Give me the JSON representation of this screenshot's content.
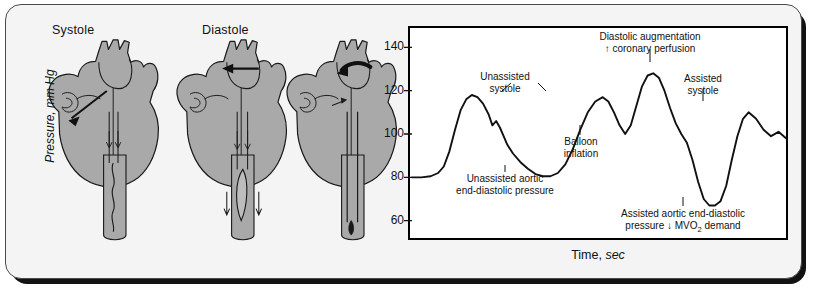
{
  "figure": {
    "anatomy": {
      "labels": [
        {
          "id": "systole",
          "text": "Systole"
        },
        {
          "id": "diastole",
          "text": "Diastole"
        }
      ]
    }
  },
  "chart_data": {
    "type": "line",
    "title": "",
    "xlabel": "Time, sec",
    "ylabel": "Pressure, mm Hg",
    "ylim": [
      52,
      148
    ],
    "yticks": [
      60,
      80,
      100,
      120,
      140
    ],
    "ytick_labels": [
      "60",
      "80",
      "100",
      "120",
      "140"
    ],
    "xlim": [
      0,
      100
    ],
    "xticks": [],
    "grid": false,
    "legend": false,
    "series": [
      {
        "name": "aortic pressure waveform",
        "x": [
          0,
          2.5,
          5,
          7,
          8.5,
          10,
          11.5,
          13,
          14.5,
          16,
          17.5,
          19,
          20.5,
          21.5,
          22.5,
          23.5,
          24.5,
          25.5,
          27,
          29,
          31,
          33,
          35,
          37,
          39,
          41,
          43,
          45,
          47,
          49,
          51,
          52.5,
          54,
          55.5,
          57,
          58.5,
          60,
          61.5,
          63,
          64.5,
          66,
          67.5,
          69,
          70.5,
          72,
          73.5,
          75,
          76.5,
          78,
          79.5,
          81,
          82.5,
          84,
          85.5,
          87,
          88.5,
          90,
          92,
          94,
          96,
          98,
          100
        ],
        "y": [
          80,
          80,
          80.5,
          82,
          85,
          92,
          102,
          111,
          116,
          118,
          117,
          114,
          109,
          104,
          106,
          103,
          99,
          95,
          91,
          87,
          84,
          81.5,
          80.5,
          80.5,
          82,
          86,
          93,
          102,
          110,
          115,
          117,
          115,
          110,
          104,
          100,
          104,
          113,
          122,
          127,
          128,
          126,
          120,
          112,
          105,
          100,
          96,
          88,
          78,
          70,
          67,
          67,
          69,
          76,
          88,
          99,
          107,
          110,
          107,
          102,
          99,
          101,
          98
        ]
      }
    ],
    "annotations": [
      {
        "id": "unassisted-systole",
        "text": "Unassisted\nsystole",
        "line1": "Unassisted",
        "line2": "systole"
      },
      {
        "id": "diastolic-augmentation",
        "text": "Diastolic augmentation\n↑ coronary perfusion",
        "line1": "Diastolic augmentation",
        "line2": "↑ coronary perfusion"
      },
      {
        "id": "balloon-inflation",
        "text": "Balloon\ninflation",
        "line1": "Balloon",
        "line2": "inflation"
      },
      {
        "id": "assisted-systole",
        "text": "Assisted\nsystole",
        "line1": "Assisted",
        "line2": "systole"
      },
      {
        "id": "unassisted-aortic-edp",
        "text": "Unassisted aortic\nend-diastolic pressure",
        "line1": "Unassisted aortic",
        "line2": "end-diastolic pressure"
      },
      {
        "id": "assisted-aortic-edp",
        "text": "Assisted aortic end-diastolic\npressure ↓ MVO2 demand",
        "line1": "Assisted aortic end-diastolic",
        "line2_pre": "pressure ↓ MVO",
        "line2_sub": "2",
        "line2_post": " demand"
      }
    ]
  },
  "colors": {
    "heart_fill": "#a9a9a9",
    "heart_fill_dark": "#9a9a9a",
    "outline": "#1a1a1a",
    "card_bg": "#f4f4f4",
    "plot_bg": "#ffffff",
    "shadow": "#121212"
  }
}
